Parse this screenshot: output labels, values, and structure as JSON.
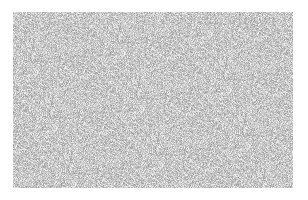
{
  "image": {
    "description": "grayscale random noise texture on white background",
    "width": 308,
    "height": 200,
    "background": "#ffffff",
    "noise_region": {
      "x": 13,
      "y": 12,
      "width": 280,
      "height": 176
    },
    "noise_gray_range": [
      150,
      250
    ],
    "noise_mean_gray": 205
  }
}
